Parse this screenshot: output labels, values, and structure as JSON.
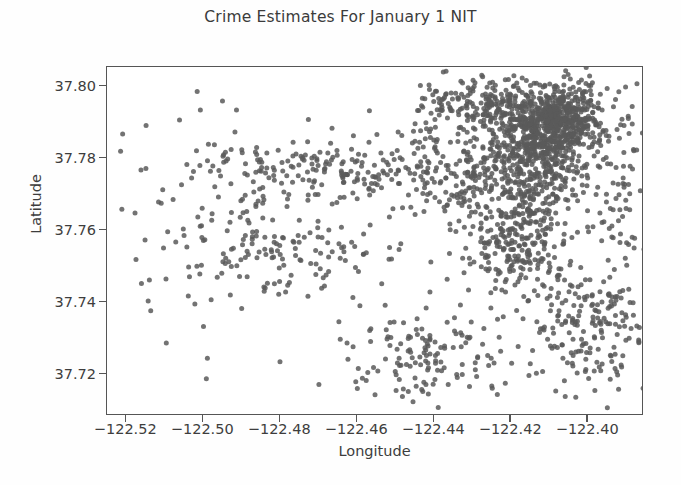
{
  "chart_data": {
    "type": "scatter",
    "title": "Crime Estimates For January 1 NIT",
    "xlabel": "Longitude",
    "ylabel": "Latitude",
    "xlim": [
      -122.525,
      -122.3855
    ],
    "ylim": [
      37.7085,
      37.8055
    ],
    "xticks": [
      -122.52,
      -122.5,
      -122.48,
      -122.46,
      -122.44,
      -122.42,
      -122.4
    ],
    "xtick_labels": [
      "−122.52",
      "−122.50",
      "−122.48",
      "−122.46",
      "−122.44",
      "−122.42",
      "−122.40"
    ],
    "yticks": [
      37.8,
      37.78,
      37.76,
      37.74,
      37.72
    ],
    "ytick_labels": [
      "37.80",
      "37.78",
      "37.76",
      "37.74",
      "37.72"
    ],
    "grid": false,
    "legend": null,
    "marker": {
      "shape": "circle",
      "color": "#5a5a5a",
      "size_px": 5,
      "opacity": 0.85
    },
    "point_count": 2400,
    "density_note": "Dense concentration in northeast quadrant (downtown), sparse in west and southwest",
    "clusters": [
      {
        "name": "downtown-core",
        "cx": -122.4085,
        "cy": 37.7905,
        "sx": 0.0062,
        "sy": 0.0048,
        "n": 560
      },
      {
        "name": "tenderloin-soma",
        "cx": -122.4145,
        "cy": 37.7805,
        "sx": 0.0075,
        "sy": 0.0068,
        "n": 430
      },
      {
        "name": "mission-district",
        "cx": -122.4185,
        "cy": 37.7585,
        "sx": 0.0078,
        "sy": 0.0085,
        "n": 300
      },
      {
        "name": "northeast-band",
        "cx": -122.4255,
        "cy": 37.7955,
        "sx": 0.0105,
        "sy": 0.0035,
        "n": 210
      },
      {
        "name": "bayview-southeast",
        "cx": -122.3995,
        "cy": 37.7325,
        "sx": 0.0082,
        "sy": 0.009,
        "n": 185
      },
      {
        "name": "western-addition",
        "cx": -122.4385,
        "cy": 37.7775,
        "sx": 0.0105,
        "sy": 0.0068,
        "n": 175
      },
      {
        "name": "richmond-sunset-corridor",
        "cx": -122.4705,
        "cy": 37.7775,
        "sx": 0.0145,
        "sy": 0.0042,
        "n": 130
      },
      {
        "name": "sunset-mid",
        "cx": -122.4765,
        "cy": 37.7545,
        "sx": 0.0155,
        "sy": 0.0072,
        "n": 120
      },
      {
        "name": "south-central",
        "cx": -122.4405,
        "cy": 37.7255,
        "sx": 0.0118,
        "sy": 0.0072,
        "n": 140
      },
      {
        "name": "far-west-sparse",
        "cx": -122.4955,
        "cy": 37.7665,
        "sx": 0.013,
        "sy": 0.0165,
        "n": 100
      },
      {
        "name": "east-waterfront",
        "cx": -122.3925,
        "cy": 37.7745,
        "sx": 0.0048,
        "sy": 0.0165,
        "n": 90
      }
    ]
  }
}
